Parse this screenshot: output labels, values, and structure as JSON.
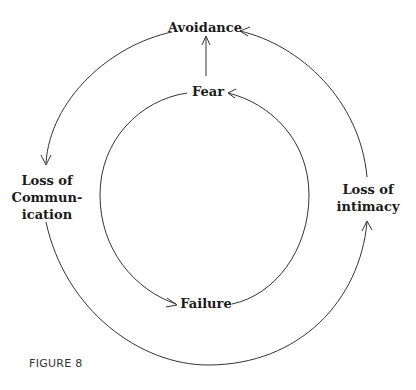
{
  "diagram": {
    "nodes": {
      "avoidance": "Avoidance",
      "fear": "Fear",
      "failure": "Failure",
      "loss_of_communication": [
        "Loss of",
        "Commun-",
        "ication"
      ],
      "loss_of_intimacy": [
        "Loss of",
        "intimacy"
      ]
    },
    "edges": [
      {
        "from": "Fear",
        "to": "Avoidance",
        "type": "straight"
      },
      {
        "from": "Avoidance",
        "to": "Loss of Communication",
        "cycle": "outer"
      },
      {
        "from": "Loss of Communication",
        "to": "Loss of intimacy",
        "cycle": "outer"
      },
      {
        "from": "Loss of intimacy",
        "to": "Avoidance",
        "cycle": "outer"
      },
      {
        "from": "Fear",
        "to": "Failure",
        "cycle": "inner"
      },
      {
        "from": "Failure",
        "to": "Fear",
        "cycle": "inner"
      }
    ],
    "caption": "FIGURE 8",
    "colors": {
      "line": "#333333",
      "text": "#1a1a1a",
      "background": "#ffffff"
    }
  }
}
